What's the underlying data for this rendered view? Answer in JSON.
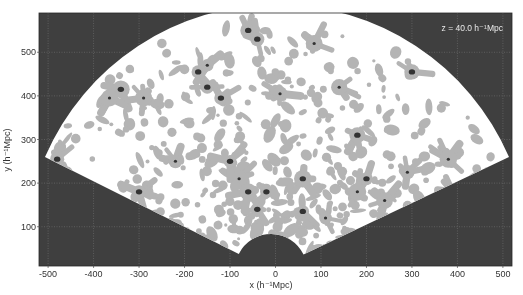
{
  "chart_data": {
    "type": "heatmap",
    "subtype": "wedge density contour map (redshift-space slice)",
    "title": "",
    "annotation": "z = 40.0 h⁻¹Mpc",
    "xlabel": "x (h⁻¹Mpc)",
    "ylabel": "y (h⁻¹Mpc)",
    "xlim": [
      -520,
      520
    ],
    "ylim": [
      10,
      590
    ],
    "xticks": [
      -500,
      -400,
      -300,
      -200,
      -100,
      0,
      100,
      200,
      300,
      400,
      500
    ],
    "yticks": [
      100,
      200,
      300,
      400,
      500
    ],
    "grid": true,
    "grid_style": "dotted light lines on dark background",
    "legend": null,
    "wedge": {
      "apex": [
        0,
        0
      ],
      "outer_radius": 580,
      "left_corner": [
        -500,
        260
      ],
      "right_corner": [
        525,
        260
      ],
      "inner_cutout_radius": 80
    },
    "contour_levels": [
      "background (white)",
      "overdense (light gray)",
      "peak (dark)"
    ],
    "colors": {
      "background": "#3f3f3f",
      "wedge": "#ffffff",
      "filament": "#b4b4b4",
      "peak": "#333333",
      "grid": "#8a8a8a"
    },
    "peaks": [
      {
        "x": -480,
        "y": 255
      },
      {
        "x": -290,
        "y": 395
      },
      {
        "x": -300,
        "y": 180
      },
      {
        "x": -220,
        "y": 250
      },
      {
        "x": -170,
        "y": 455
      },
      {
        "x": -120,
        "y": 395
      },
      {
        "x": -60,
        "y": 550
      },
      {
        "x": -40,
        "y": 530
      },
      {
        "x": -150,
        "y": 420
      },
      {
        "x": -150,
        "y": 470
      },
      {
        "x": 10,
        "y": 405
      },
      {
        "x": -80,
        "y": 210
      },
      {
        "x": -100,
        "y": 250
      },
      {
        "x": -60,
        "y": 180
      },
      {
        "x": -40,
        "y": 140
      },
      {
        "x": 10,
        "y": 70
      },
      {
        "x": -20,
        "y": 180
      },
      {
        "x": 60,
        "y": 210
      },
      {
        "x": 60,
        "y": 135
      },
      {
        "x": 110,
        "y": 120
      },
      {
        "x": 200,
        "y": 210
      },
      {
        "x": 180,
        "y": 310
      },
      {
        "x": 180,
        "y": 180
      },
      {
        "x": 240,
        "y": 160
      },
      {
        "x": 290,
        "y": 225
      },
      {
        "x": 300,
        "y": 455
      },
      {
        "x": 380,
        "y": 255
      },
      {
        "x": -340,
        "y": 415
      },
      {
        "x": -365,
        "y": 395
      },
      {
        "x": 390,
        "y": 180
      },
      {
        "x": 140,
        "y": 420
      },
      {
        "x": 85,
        "y": 520
      }
    ]
  }
}
